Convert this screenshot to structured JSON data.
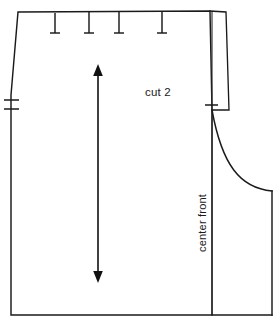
{
  "drawing": {
    "title": "Sewing pattern piece diagram",
    "background_color": "#ffffff",
    "line_color": "#1a1a1a",
    "labels": {
      "cut_quantity": "cut 2",
      "center_front": "center front"
    },
    "icons": {
      "grainline": "grainline-double-arrow-icon",
      "notch": "notch-mark-icon",
      "dart": "dart-leg-mark-icon"
    }
  },
  "geometry": {
    "canvas": {
      "width": 278,
      "height": 328
    },
    "body_outline_points": [
      [
        18,
        12
      ],
      [
        210,
        11
      ],
      [
        212,
        110
      ],
      [
        212,
        315
      ],
      [
        11,
        315
      ],
      [
        11,
        95
      ],
      [
        18,
        12
      ]
    ],
    "top_edge": {
      "x1": 18,
      "y1": 12,
      "x2": 210,
      "y2": 11
    },
    "bottom_edge": {
      "x1": 11,
      "y1": 315,
      "x2": 272,
      "y2": 315
    },
    "left_edge_upper": {
      "x1": 18,
      "y1": 12,
      "x2": 11,
      "y2": 95
    },
    "left_edge_lower": {
      "x1": 11,
      "y1": 95,
      "x2": 11,
      "y2": 315
    },
    "center_front_line": {
      "x": 212,
      "y1": 11,
      "y2": 315
    },
    "facing_strip": {
      "top": {
        "x1": 210,
        "y1": 11,
        "x2": 226,
        "y2": 12
      },
      "outer": {
        "x1": 226,
        "y1": 12,
        "x2": 229,
        "y2": 110
      },
      "bottom": {
        "x1": 229,
        "y1": 110,
        "x2": 212,
        "y2": 110
      }
    },
    "armhole_curve": {
      "start": [
        212,
        110
      ],
      "control_1": [
        222,
        165
      ],
      "control_2": [
        240,
        188
      ],
      "end": [
        272,
        191
      ]
    },
    "side_seam": {
      "x": 272,
      "y1": 191,
      "y2": 315
    },
    "dart_marks": [
      {
        "x": 55,
        "y_top": 13,
        "y_bottom": 33,
        "bar_half_width": 5
      },
      {
        "x": 89,
        "y_top": 12,
        "y_bottom": 33,
        "bar_half_width": 5
      },
      {
        "x": 119,
        "y_top": 12,
        "y_bottom": 33,
        "bar_half_width": 5
      },
      {
        "x": 162,
        "y_top": 12,
        "y_bottom": 33,
        "bar_half_width": 5
      }
    ],
    "left_notches": [
      {
        "y": 100,
        "x1": 4,
        "x2": 19
      },
      {
        "y": 109,
        "x1": 4,
        "x2": 19
      }
    ],
    "right_notch": {
      "y": 105,
      "x1": 205,
      "x2": 218
    },
    "grainline": {
      "x": 98,
      "y_top": 66,
      "y_bottom": 281,
      "arrow_half_width": 4.5,
      "arrow_length": 9
    },
    "label_positions": {
      "cut_quantity": {
        "x": 145,
        "y": 96
      },
      "center_front": {
        "x": 206,
        "y": 252
      }
    }
  }
}
